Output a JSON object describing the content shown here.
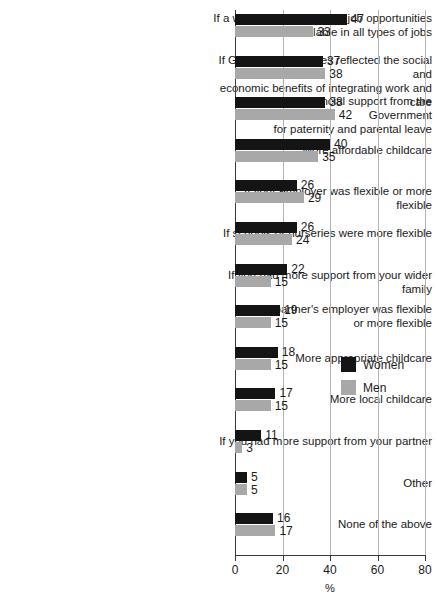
{
  "chart_data": {
    "type": "bar",
    "orientation": "horizontal",
    "title": "",
    "subtitle": "",
    "xlabel": "%",
    "ylabel": "",
    "xlim": [
      0,
      80
    ],
    "xticks": [
      0,
      20,
      40,
      60,
      80
    ],
    "xtick_labels": [
      "0",
      "20",
      "40",
      "60",
      "80"
    ],
    "grid": true,
    "grid_axis": "x",
    "legend_position": "right-middle",
    "categories": [
      "If a wider range of flexible job opportunities\nwere available in all types of jobs",
      "If Government policies reflected the social and\neconomic benefits of integrating work and care",
      "More financial support from the Government\nfor paternity and parental leave",
      "More affordable childcare",
      "If your employer was flexible or more flexible",
      "If schools or nurseries were more flexible",
      "If you had more support from your wider family",
      "If your partner's employer was flexible\nor more flexible",
      "More appropriate childcare",
      "More local childcare",
      "If you had more support from your partner",
      "Other",
      "None of the above"
    ],
    "series": [
      {
        "name": "Women",
        "color": "#141414",
        "values": [
          47,
          37,
          38,
          40,
          26,
          26,
          22,
          19,
          18,
          17,
          11,
          5,
          16
        ]
      },
      {
        "name": "Men",
        "color": "#a8a8a8",
        "values": [
          33,
          38,
          42,
          35,
          29,
          24,
          15,
          15,
          15,
          15,
          3,
          5,
          17
        ]
      }
    ]
  },
  "legend": {
    "items": [
      {
        "label": "Women",
        "color": "#141414"
      },
      {
        "label": "Men",
        "color": "#a8a8a8"
      }
    ]
  },
  "axis": {
    "x_title": "%"
  }
}
